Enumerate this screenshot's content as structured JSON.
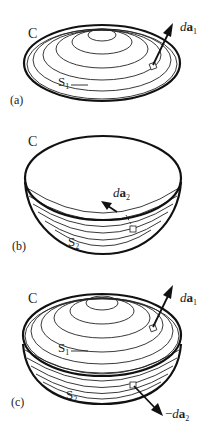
{
  "figure": {
    "panels": [
      {
        "id": "a",
        "panel_label": "(a)",
        "curve_label": "C",
        "surface_label": "S",
        "surface_sub": "1",
        "vector_prefix": "d",
        "vector_bold": "a",
        "vector_sub": "1",
        "vector_sign": ""
      },
      {
        "id": "b",
        "panel_label": "(b)",
        "curve_label": "C",
        "surface_label": "S",
        "surface_sub": "2",
        "vector_prefix": "d",
        "vector_bold": "a",
        "vector_sub": "2",
        "vector_sign": ""
      },
      {
        "id": "c",
        "panel_label": "(c)",
        "curve_label": "C",
        "surface1_label": "S",
        "surface1_sub": "1",
        "surface2_label": "S",
        "surface2_sub": "2",
        "vector1_prefix": "d",
        "vector1_bold": "a",
        "vector1_sub": "1",
        "vector2_sign": "−",
        "vector2_prefix": "d",
        "vector2_bold": "a",
        "vector2_sub": "2"
      }
    ],
    "colors": {
      "stroke": "#111111",
      "background": "#ffffff"
    }
  }
}
